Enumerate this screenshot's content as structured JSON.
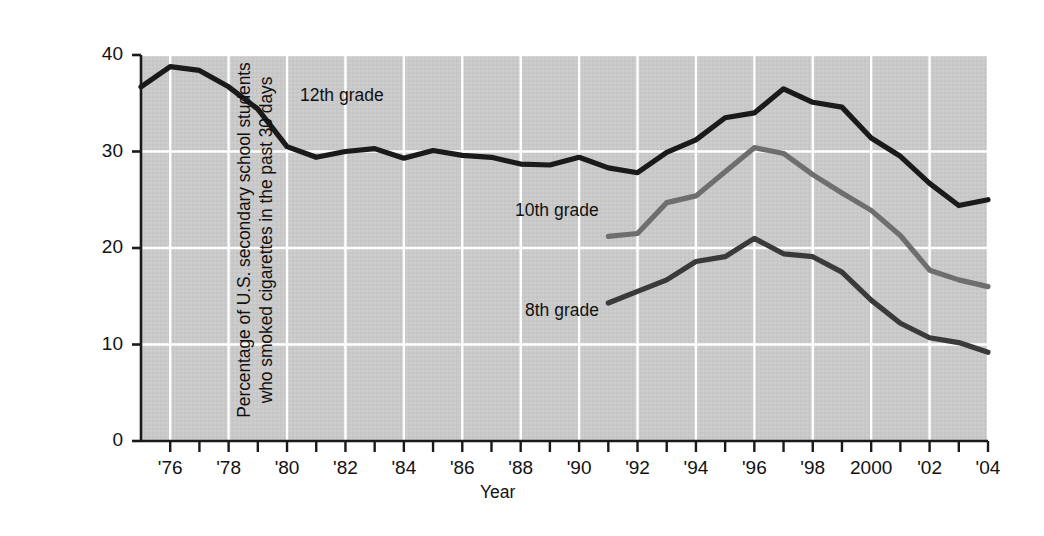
{
  "chart_data": {
    "type": "line",
    "title": "",
    "xlabel": "Year",
    "ylabel": "Percentage of U.S. secondary school students who smoked cigarettes in the past 30 days",
    "ylabel_line1": "Percentage of U.S. secondary school students",
    "ylabel_line2": "who smoked cigarettes in the past 30 days",
    "xlim": [
      1975,
      2004
    ],
    "ylim": [
      0,
      40
    ],
    "yticks": [
      0,
      10,
      20,
      30,
      40
    ],
    "ytick_labels": [
      "0",
      "10",
      "20",
      "30",
      "40"
    ],
    "xticks": [
      1976,
      1978,
      1980,
      1982,
      1984,
      1986,
      1988,
      1990,
      1992,
      1994,
      1996,
      1998,
      2000,
      2002,
      2004
    ],
    "xtick_labels": [
      "'76",
      "'78",
      "'80",
      "'82",
      "'84",
      "'86",
      "'88",
      "'90",
      "'92",
      "'94",
      "'96",
      "'98",
      "2000",
      "'02",
      "'04"
    ],
    "xminor_ticks_every": 1,
    "grid": true,
    "grid_color": "#ffffff",
    "plot_background": "#c9c9c9",
    "legend_position": "inline-annotations",
    "series": [
      {
        "name": "12th grade",
        "color": "#1a1a1a",
        "label_text": "12th grade",
        "x": [
          1975,
          1976,
          1977,
          1978,
          1979,
          1980,
          1981,
          1982,
          1983,
          1984,
          1985,
          1986,
          1987,
          1988,
          1989,
          1990,
          1991,
          1992,
          1993,
          1994,
          1995,
          1996,
          1997,
          1998,
          1999,
          2000,
          2001,
          2002,
          2003,
          2004
        ],
        "values": [
          36.7,
          38.8,
          38.4,
          36.7,
          34.4,
          30.5,
          29.4,
          30.0,
          30.3,
          29.3,
          30.1,
          29.6,
          29.4,
          28.7,
          28.6,
          29.4,
          28.3,
          27.8,
          29.9,
          31.2,
          33.5,
          34.0,
          36.5,
          35.1,
          34.6,
          31.4,
          29.5,
          26.7,
          24.4,
          25.0
        ],
        "annotation_pos": {
          "x_px": 300,
          "y_px": 85
        }
      },
      {
        "name": "10th grade",
        "color": "#6e6e6e",
        "label_text": "10th grade",
        "x": [
          1991,
          1992,
          1993,
          1994,
          1995,
          1996,
          1997,
          1998,
          1999,
          2000,
          2001,
          2002,
          2003,
          2004
        ],
        "values": [
          21.2,
          21.5,
          24.7,
          25.4,
          27.9,
          30.4,
          29.8,
          27.6,
          25.7,
          23.9,
          21.3,
          17.7,
          16.7,
          16.0
        ],
        "annotation_pos": {
          "x_px": 515,
          "y_px": 200
        }
      },
      {
        "name": "8th grade",
        "color": "#3a3a3a",
        "label_text": "8th grade",
        "x": [
          1991,
          1992,
          1993,
          1994,
          1995,
          1996,
          1997,
          1998,
          1999,
          2000,
          2001,
          2002,
          2003,
          2004
        ],
        "values": [
          14.3,
          15.5,
          16.7,
          18.6,
          19.1,
          21.0,
          19.4,
          19.1,
          17.5,
          14.6,
          12.2,
          10.7,
          10.2,
          9.2
        ],
        "annotation_pos": {
          "x_px": 525,
          "y_px": 300
        }
      }
    ]
  },
  "geometry": {
    "plot_left": 141,
    "plot_right": 988,
    "plot_top": 55,
    "plot_bottom": 441
  }
}
